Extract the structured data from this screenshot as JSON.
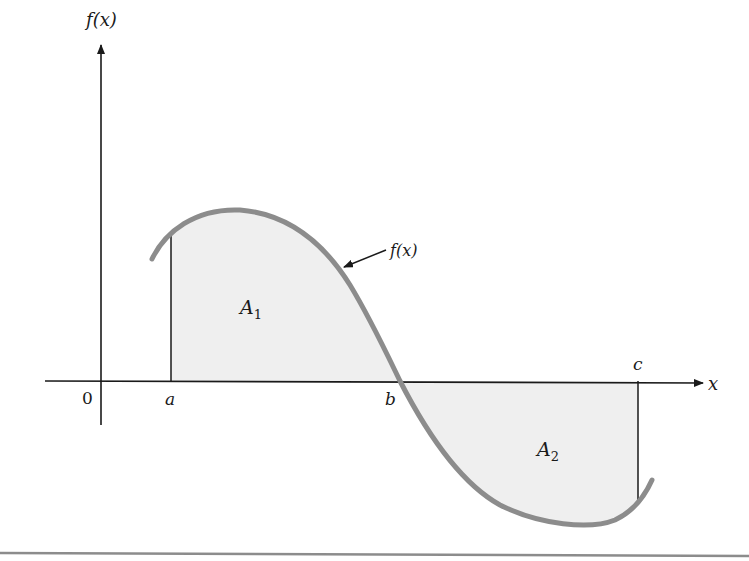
{
  "figure": {
    "y_axis_label": "f(x)",
    "x_axis_label": "x",
    "origin_label": "0",
    "points": {
      "a": "a",
      "b": "b",
      "c": "c"
    },
    "curve_label": "f(x)",
    "regions": {
      "A1": {
        "name": "A",
        "subscript": "1"
      },
      "A2": {
        "name": "A",
        "subscript": "2"
      }
    },
    "colors": {
      "curve": "#8c8c8c",
      "fill": "#efefef",
      "axis": "#1a1a1a",
      "rule": "#8c8c8c"
    }
  }
}
